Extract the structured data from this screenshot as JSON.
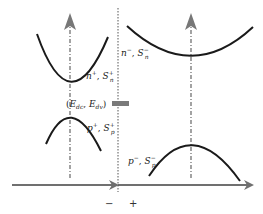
{
  "diagram": {
    "title": "",
    "colors": {
      "curve": "#1a1a1a",
      "axis": "#6e6e6e",
      "guide": "#555555",
      "level_bar": "#7a7a7a"
    },
    "left_region": {
      "conduction_band": {
        "carrier": "n",
        "carrier_sup": "+",
        "sep": ", ",
        "spin": "S",
        "spin_sub": "n",
        "spin_sup": "+"
      },
      "valence_band": {
        "carrier": "p",
        "carrier_sup": "+",
        "sep": ", ",
        "spin": "S",
        "spin_sub": "p",
        "spin_sup": "+"
      },
      "level_label": {
        "open": "(",
        "e1": "E",
        "e1_sub": "dc",
        "sep": ", ",
        "e2": "E",
        "e2_sub": "dv",
        "close": ")"
      }
    },
    "right_region": {
      "conduction_band": {
        "carrier": "n",
        "carrier_sup": "−",
        "sep": ", ",
        "spin": "S",
        "spin_sub": "n",
        "spin_sup": "−"
      },
      "valence_band": {
        "carrier": "p",
        "carrier_sup": "−",
        "sep": ", ",
        "spin": "S",
        "spin_sub": "p",
        "spin_sup": "−"
      }
    },
    "junction_signs": {
      "left": "−",
      "right": "+"
    }
  }
}
